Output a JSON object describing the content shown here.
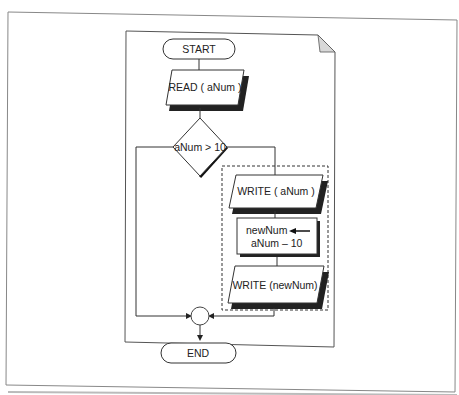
{
  "diagram": {
    "type": "flowchart",
    "nodes": {
      "start": {
        "shape": "terminator",
        "label": "START"
      },
      "read": {
        "shape": "input-output",
        "label": "READ  ( aNum )"
      },
      "decision": {
        "shape": "decision",
        "label": "aNum  > 10"
      },
      "write_anum": {
        "shape": "input-output",
        "label": "WRITE  (  aNum )"
      },
      "assign": {
        "shape": "process",
        "line1": "newNum",
        "line2": "aNum  – 10"
      },
      "write_newnum": {
        "shape": "input-output",
        "label": "WRITE  (newNum)"
      },
      "connector": {
        "shape": "connector",
        "label": ""
      },
      "end": {
        "shape": "terminator",
        "label": "END"
      }
    },
    "edges": [
      {
        "from": "start",
        "to": "read"
      },
      {
        "from": "read",
        "to": "decision"
      },
      {
        "from": "decision",
        "to": "write_anum",
        "branch": "right (true)"
      },
      {
        "from": "decision",
        "to": "connector",
        "branch": "left (false)"
      },
      {
        "from": "write_anum",
        "to": "assign"
      },
      {
        "from": "assign",
        "to": "write_newnum"
      },
      {
        "from": "write_newnum",
        "to": "connector"
      },
      {
        "from": "connector",
        "to": "end"
      }
    ],
    "group": {
      "style": "dashed",
      "contains": [
        "write_anum",
        "assign",
        "write_newnum"
      ]
    }
  },
  "colors": {
    "stroke": "#222222",
    "page_fold": "#d8d8d8",
    "frame": "#777777"
  }
}
